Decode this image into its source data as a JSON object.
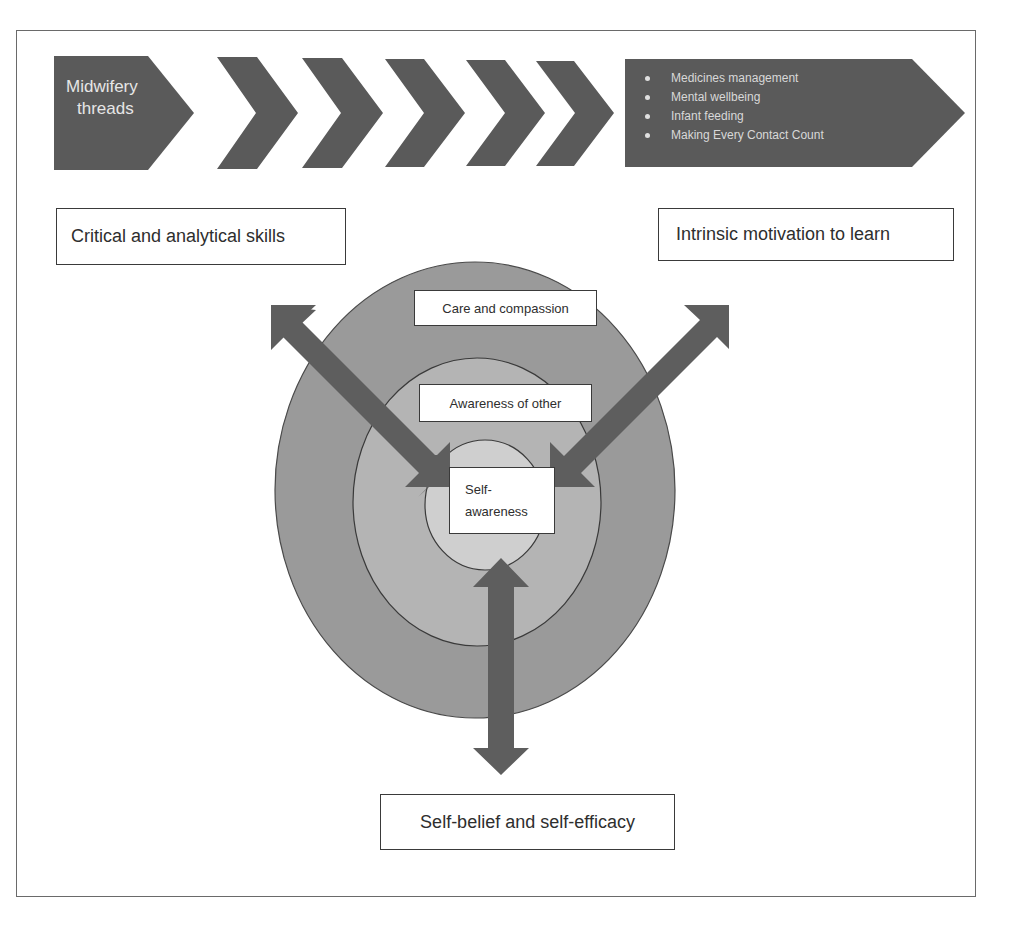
{
  "header": {
    "start_chevron_label": "Midwifery threads",
    "start_chevron_line1": "Midwifery",
    "start_chevron_line2": "threads",
    "chevron_count": 5,
    "end_arrow_items": [
      "Medicines management",
      "Mental wellbeing",
      "Infant feeding",
      "Making Every Contact Count"
    ]
  },
  "boxes": {
    "top_left": "Critical and analytical skills",
    "top_right": "Intrinsic motivation to learn",
    "bottom": "Self-belief and self-efficacy"
  },
  "rings": {
    "outer": "Care and compassion",
    "middle": "Awareness of other",
    "inner_line1": "Self-",
    "inner_line2": "awareness"
  },
  "arrows": [
    {
      "from": "top_left",
      "to": "center",
      "type": "double-headed"
    },
    {
      "from": "top_right",
      "to": "center",
      "type": "double-headed"
    },
    {
      "from": "bottom",
      "to": "center",
      "type": "double-headed"
    }
  ],
  "colors": {
    "chevron_fill": "#5a5a5a",
    "arrow_fill": "#5e5e5e",
    "outer_ring": "#9a9a9a",
    "middle_ring": "#b4b4b4",
    "inner_ring": "#cfcfcf",
    "border": "#3a3a3a"
  }
}
